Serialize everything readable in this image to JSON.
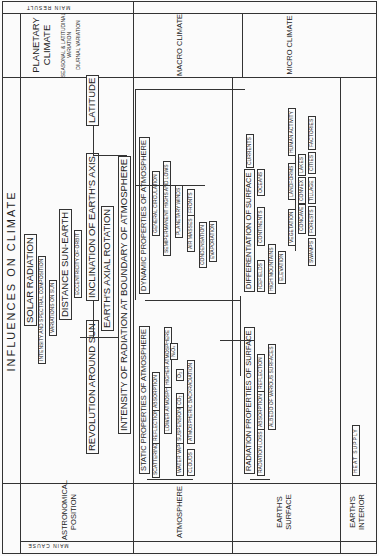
{
  "title": "INFLUENCES ON CLIMATE",
  "header": {
    "main_cause": "MAIN CAUSE",
    "main_result": "MAIN RESULT"
  },
  "causes": [
    "ASTRONOMICAL POSITION",
    "ATMOSPHERE",
    "EARTH'S SURFACE",
    "EARTH'S INTERIOR"
  ],
  "results": {
    "planetary": "PLANETARY CLIMATE",
    "seasonal": "SEASONAL & LATITUDINAL VARIATION",
    "diurnal": "DIURNAL VARIATION",
    "macro": "MACRO CLIMATE",
    "micro": "MICRO CLIMATE"
  },
  "astronomical": {
    "solar_radiation": "SOLAR RADIATION",
    "intensity": "INTENSITY AND SPECTRAL COMPOSITION",
    "variations": "VARIATIONS ON SUN",
    "distance": "DISTANCE SUN-EARTH",
    "eccentricity": "ECCENTRICITY OF ORBIT",
    "revolution": "REVOLUTION AROUND SUN",
    "inclination": "INCLINATION OF EARTH'S AXIS",
    "latitude": "LATITUDE",
    "rotation": "EARTH'S AXIAL ROTATION"
  },
  "atmosphere": {
    "boundary": "INTENSITY OF RADIATION AT BOUNDARY OF ATMOSPHERE",
    "static": "STATIC PROPERTIES OF ATMOSPHERE",
    "scattering": "SCATTERING",
    "reflection": "REFLECTION",
    "absorption": "ABSORPTION",
    "lower": "LOWER ATMOSPHERE",
    "higher": "HIGHER ATMOSPHERE",
    "water_vapor": "WATER VAPOR",
    "suspensions": "SUSPENSIONS",
    "co2": "CO₂",
    "o3": "O₃",
    "nxox": "NₓOₓ",
    "clouds": "CLOUDS",
    "backradiation": "ATMOSPHERIC BACKRADIATION",
    "dynamic": "DYNAMIC PROPERTIES OF ATMOSPHERE",
    "general": "GENERAL CIRCULATION",
    "semipermanent": "SEMIPERMANENT HIGHS AND LOWS",
    "planetary_winds": "PLANETARY WINDS",
    "air_masses": "AIR MASSES",
    "fronts": "FRONTS",
    "condensation": "CONDENSATION",
    "evaporation": "EVAPORATION"
  },
  "surface": {
    "radiation_props": "RADIATION PROPERTIES OF SURFACE",
    "radiation_loss": "RADIATION LOSS",
    "absorption": "ABSORPTION",
    "reflection": "REFLECTION",
    "albedo": "ALBEDO OF VARIOUS SURFACES",
    "differentiation": "DIFFERENTIATION OF SURFACE",
    "icefields": "ICEFIELDS",
    "continents": "CONTINENTS",
    "oceans": "OCEANS",
    "currents": "CURRENTS",
    "high_mountains": "HIGH MOUNTAINS",
    "elevation": "ELEVATION",
    "vegetation": "VEGETATION",
    "landforms": "LANDFORMS",
    "human": "HUMAN ACTIVITY",
    "concave": "CONCAVE",
    "convex": "CONVEX",
    "lakes": "LAKES",
    "swamps": "SWAMPS",
    "forests": "FORESTS",
    "tillage": "TILLAGE",
    "cities": "CITIES",
    "factories": "FACTORIES"
  },
  "interior": {
    "heat_supply": "HEAT SUPPLY"
  }
}
